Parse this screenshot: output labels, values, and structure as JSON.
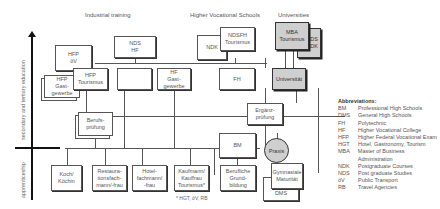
{
  "headers": {
    "industrial": "Industrial training",
    "hvs": "Higher Vocational Schools",
    "universities": "Universities"
  },
  "axis": {
    "upper": "secondary and tertiary education",
    "lower": "apprenticeship"
  },
  "boxes": {
    "hfp_ov": "HFP\nöV",
    "hfp_gast": "HFP\nGast-\ngewerbe",
    "hfp_tour": "HFP\nTourismus",
    "nds_hf": "NDS\nHF",
    "hf_tour": "HF\nTourismus",
    "hf_gast": "HF\nGast-\ngewerbe",
    "ndk": "NDK",
    "ndsfh": "NDSFH\nTourismus",
    "fh": "FH",
    "mba": "MBA\nTourismus",
    "nds_ndk": "NDS\nNDK",
    "uni": "Universität",
    "berufs": "Berufs-\nprüfung",
    "ergaenz": "Ergänz-\nprüfung",
    "bm": "BM",
    "praxis": "Praxis",
    "koch": "Koch/\nKöchin",
    "restaurant": "Restaura-\ntionsfach-\nmann/-frau",
    "hotel": "Hotel-\nfachmann/\n-frau",
    "kaufmann": "Kaufmann/\nKauffrau\nTourismus*",
    "berufliche": "Berufliche\nGrund-\nbildung",
    "gymnasiale": "Gymnasiale\nMaturität",
    "dms": "DMS"
  },
  "footnote": "* HGT, öV, RB",
  "abbreviations": {
    "title": "Abbreviations:",
    "items": [
      {
        "k": "BM",
        "v": "Professional High Schools"
      },
      {
        "k": "DMS",
        "v": "General High Schools"
      },
      {
        "k": "FH",
        "v": "Polytechnic"
      },
      {
        "k": "HF",
        "v": "Higher Vocational College"
      },
      {
        "k": "HFP",
        "v": "Higher Federal Vocational Exam"
      },
      {
        "k": "HGT",
        "v": "Hotel, Gastronomy, Tourism"
      },
      {
        "k": "MBA",
        "v": "Master of Business Administration"
      },
      {
        "k": "NDK",
        "v": "Postgraduate Courses"
      },
      {
        "k": "NDS",
        "v": "Post graduate Studies"
      },
      {
        "k": "öV",
        "v": "Public Transport"
      },
      {
        "k": "RB",
        "v": "Travel Agencies"
      }
    ]
  },
  "colors": {
    "line": "#555555",
    "grey_box": "#cfcfcf"
  }
}
